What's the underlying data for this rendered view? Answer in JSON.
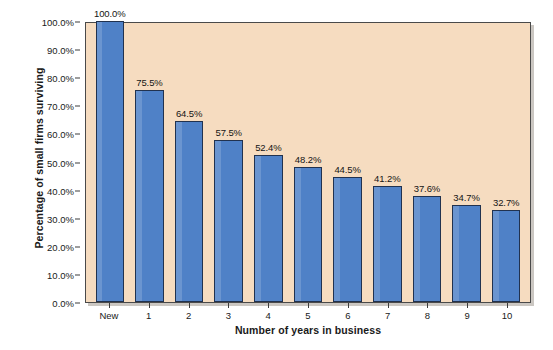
{
  "chart_data": {
    "type": "bar",
    "title": "",
    "xlabel": "Number of years in business",
    "ylabel": "Percentage of small firms surviving",
    "categories": [
      "New",
      "1",
      "2",
      "3",
      "4",
      "5",
      "6",
      "7",
      "8",
      "9",
      "10"
    ],
    "values": [
      100.0,
      75.5,
      64.5,
      57.5,
      52.4,
      48.2,
      44.5,
      41.2,
      37.6,
      34.7,
      32.7
    ],
    "data_labels": [
      "100.0%",
      "75.5%",
      "64.5%",
      "57.5%",
      "52.4%",
      "48.2%",
      "44.5%",
      "41.2%",
      "37.6%",
      "34.7%",
      "32.7%"
    ],
    "ylim": [
      0,
      100
    ],
    "y_ticks": [
      0,
      10,
      20,
      30,
      40,
      50,
      60,
      70,
      80,
      90,
      100
    ],
    "y_tick_labels": [
      "0.0%",
      "10.0%",
      "20.0%",
      "30.0%",
      "40.0%",
      "50.0%",
      "60.0%",
      "70.0%",
      "80.0%",
      "90.0%",
      "100.0%"
    ],
    "grid": false,
    "legend": "none",
    "series": [
      {
        "name": "Percentage of small firms surviving",
        "values": [
          100.0,
          75.5,
          64.5,
          57.5,
          52.4,
          48.2,
          44.5,
          41.2,
          37.6,
          34.7,
          32.7
        ]
      }
    ]
  },
  "colors": {
    "bar_fill": "#4f81c7",
    "bar_edge": "#21324f",
    "plot_background": "#f6dcc0",
    "plot_border": "#4a4a4a",
    "figure_background": "#ffffff",
    "text": "#1a1a1a"
  }
}
